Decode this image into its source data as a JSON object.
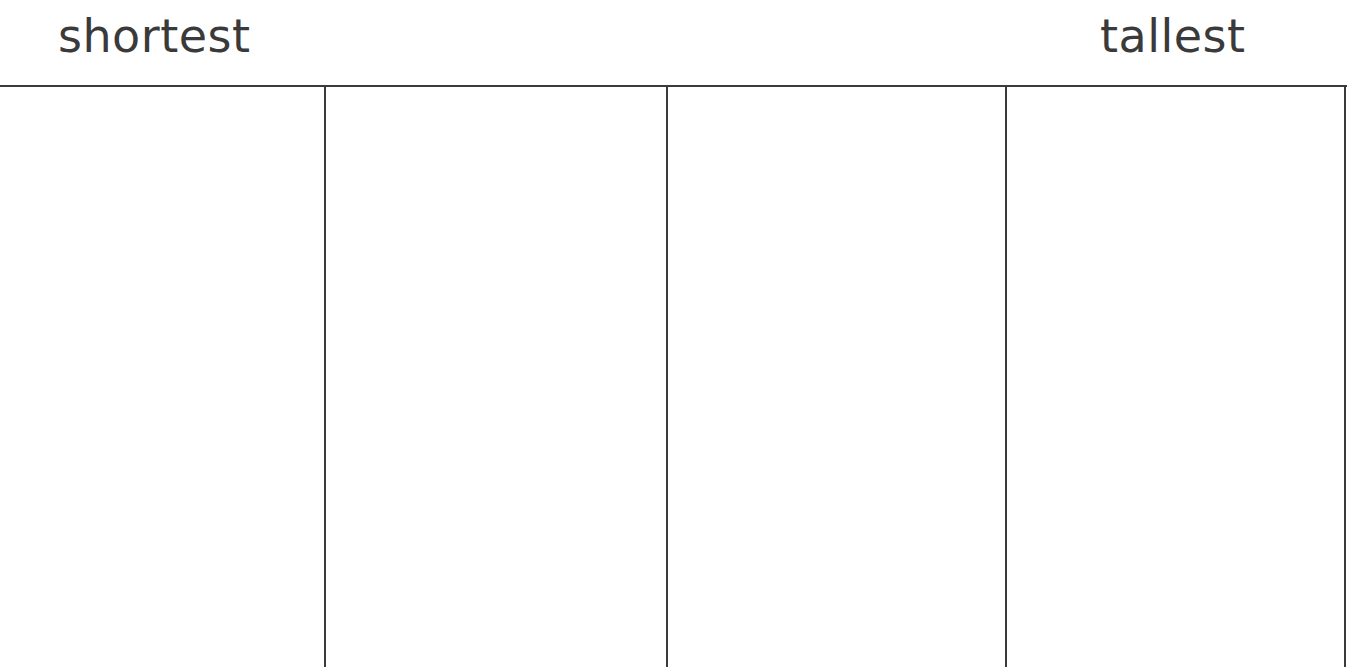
{
  "header": {
    "left_label": "shortest",
    "right_label": "tallest"
  },
  "table": {
    "columns": [
      {
        "index": 1,
        "content": ""
      },
      {
        "index": 2,
        "content": ""
      },
      {
        "index": 3,
        "content": ""
      },
      {
        "index": 4,
        "content": ""
      }
    ]
  }
}
